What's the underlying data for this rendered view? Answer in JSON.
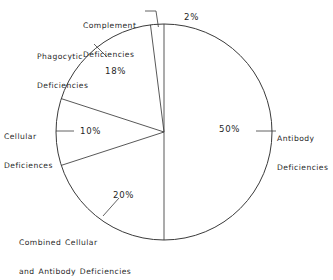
{
  "chart_data": {
    "type": "pie",
    "title": "",
    "subtitle": "",
    "xlabel": "",
    "ylabel": "",
    "legend_position": "none",
    "grid": false,
    "start_angle_deg": 0,
    "direction": "clockwise",
    "units": "percent",
    "categories": [
      "Antibody Deficiencies",
      "Combined Cellular and Antibody Deficiencies",
      "Cellular Deficiences",
      "Phagocytic Deficiencies",
      "Complement Deficiencies"
    ],
    "values": [
      50,
      20,
      10,
      18,
      2
    ],
    "slices": [
      {
        "name": "antibody",
        "label": "Antibody\nDeficiencies",
        "value_label": "50%",
        "value": 50,
        "start_deg": 0,
        "end_deg": 180
      },
      {
        "name": "combined-cellular-antibody",
        "label": "Combined Cellular\nand Antibody Deficiencies",
        "value_label": "20%",
        "value": 20,
        "start_deg": 180,
        "end_deg": 252
      },
      {
        "name": "cellular",
        "label": "Cellular\nDeficiences",
        "value_label": "10%",
        "value": 10,
        "start_deg": 252,
        "end_deg": 288
      },
      {
        "name": "phagocytic",
        "label": "Phagocytic\nDeficiencies",
        "value_label": "18%",
        "value": 18,
        "start_deg": 288,
        "end_deg": 352.8
      },
      {
        "name": "complement",
        "label": "Complement\nDeficiencies",
        "value_label": "2%",
        "value": 2,
        "start_deg": 352.8,
        "end_deg": 360
      }
    ]
  },
  "labels": {
    "complement": {
      "line1": "Complement",
      "line2": "Deficiencies"
    },
    "phagocytic": {
      "line1": "Phagocytic",
      "line2": "Deficiencies"
    },
    "cellular": {
      "line1": "Cellular",
      "line2": "Deficiences"
    },
    "combined": {
      "line1": "Combined Cellular",
      "line2": "and Antibody Deficiencies"
    },
    "antibody": {
      "line1": "Antibody",
      "line2": "Deficiencies"
    }
  },
  "percents": {
    "complement": "2%",
    "phagocytic": "18%",
    "cellular": "10%",
    "combined": "20%",
    "antibody": "50%"
  },
  "colors": {
    "stroke": "#3a3a3a",
    "text": "#1f1f1f",
    "background": "#ffffff"
  },
  "geometry": {
    "center_x": 164,
    "center_y": 132,
    "radius": 108
  }
}
